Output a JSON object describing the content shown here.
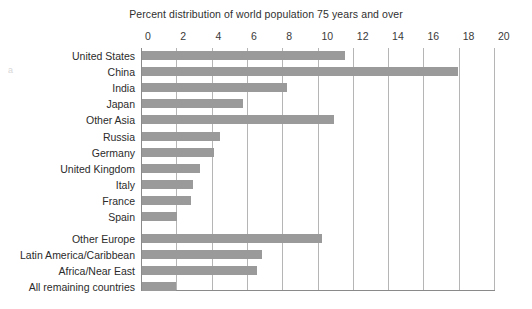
{
  "chart_data": {
    "type": "bar",
    "orientation": "horizontal",
    "title": "Percent distribution of world population 75 years and over",
    "xlabel": "",
    "ylabel": "",
    "xlim": [
      0,
      20
    ],
    "xticks": [
      0,
      2,
      4,
      6,
      8,
      10,
      12,
      14,
      16,
      18,
      20
    ],
    "xtick_labels": [
      "0",
      "2",
      "4",
      "6",
      "8",
      "10",
      "12",
      "14",
      "16",
      "18",
      "20"
    ],
    "grid": "vertical",
    "legend": "none",
    "bar_color": "#9a9a9a",
    "gridline_color": "#b5b5b5",
    "axis_color": "#8a8a8a",
    "categories": [
      "United States",
      "China",
      "India",
      "Japan",
      "Other Asia",
      "Russia",
      "Germany",
      "United Kingdom",
      "Italy",
      "France",
      "Spain",
      "Other Europe",
      "Latin America/Caribbean",
      "Africa/Near East",
      "All remaining countries"
    ],
    "values": [
      11.5,
      17.9,
      8.2,
      5.7,
      10.9,
      4.4,
      4.1,
      3.3,
      2.9,
      2.8,
      2.0,
      10.2,
      6.8,
      6.5,
      1.9
    ]
  }
}
